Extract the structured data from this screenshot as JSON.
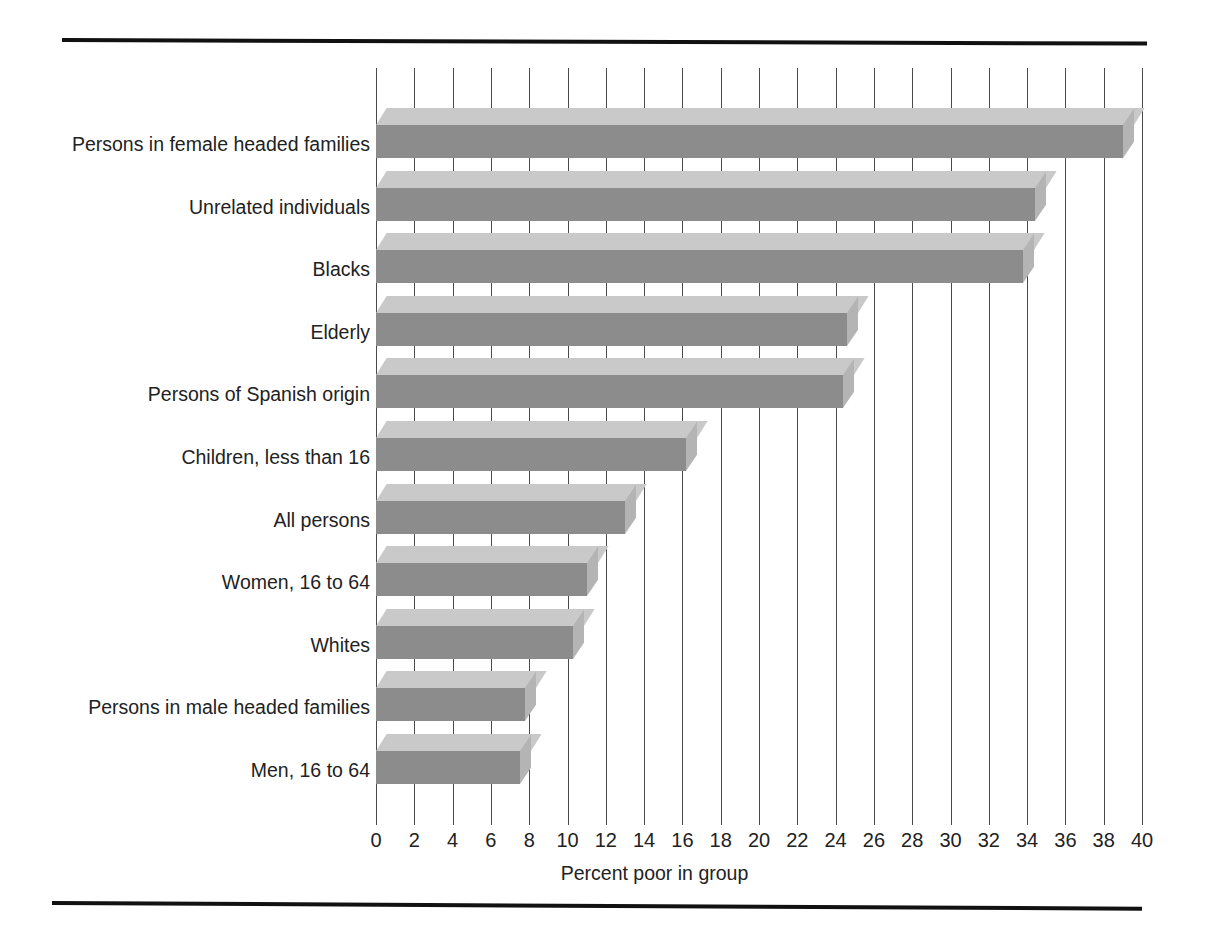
{
  "chart_data": {
    "type": "bar",
    "orientation": "horizontal",
    "title": "",
    "xlabel": "Percent poor in group",
    "ylabel": "",
    "xlim": [
      0,
      40
    ],
    "xticks": [
      0,
      2,
      4,
      6,
      8,
      10,
      12,
      14,
      16,
      18,
      20,
      22,
      24,
      26,
      28,
      30,
      32,
      34,
      36,
      38,
      40
    ],
    "grid": "vertical",
    "legend": "none",
    "categories": [
      "Persons in female headed families",
      "Unrelated individuals",
      "Blacks",
      "Elderly",
      "Persons of Spanish origin",
      "Children, less than 16",
      "All persons",
      "Women, 16 to 64",
      "Whites",
      "Persons in male headed families",
      "Men, 16 to 64"
    ],
    "values": [
      39.0,
      34.4,
      33.8,
      24.6,
      24.4,
      16.2,
      13.0,
      11.0,
      10.3,
      7.8,
      7.5
    ],
    "bar_face_color": "#8c8c8c",
    "bar_top_color": "#c9c9c9",
    "bar_side_color": "#b4b4b4",
    "gridline_color": "#4a4a4a",
    "rule_color": "#111111"
  },
  "axis": {
    "x_title": "Percent poor in group",
    "tick_labels": [
      "0",
      "2",
      "4",
      "6",
      "8",
      "10",
      "12",
      "14",
      "16",
      "18",
      "20",
      "22",
      "24",
      "26",
      "28",
      "30",
      "32",
      "34",
      "36",
      "38",
      "40"
    ]
  },
  "bars": [
    {
      "label": "Persons in female headed families",
      "value": 39.0
    },
    {
      "label": "Unrelated individuals",
      "value": 34.4
    },
    {
      "label": "Blacks",
      "value": 33.8
    },
    {
      "label": "Elderly",
      "value": 24.6
    },
    {
      "label": "Persons of Spanish origin",
      "value": 24.4
    },
    {
      "label": "Children, less than 16",
      "value": 16.2
    },
    {
      "label": "All persons",
      "value": 13.0
    },
    {
      "label": "Women, 16 to 64",
      "value": 11.0
    },
    {
      "label": "Whites",
      "value": 10.3
    },
    {
      "label": "Persons in male headed families",
      "value": 7.8
    },
    {
      "label": "Men, 16 to 64",
      "value": 7.5
    }
  ]
}
